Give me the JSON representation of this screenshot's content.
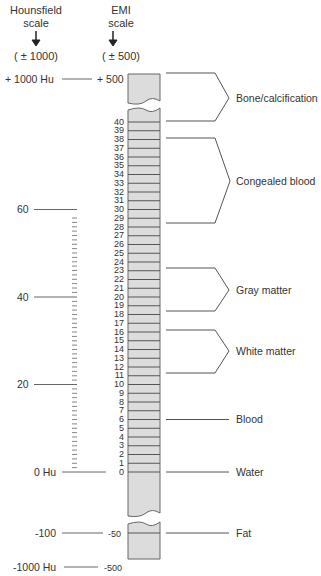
{
  "header": {
    "hounsfield": {
      "line1": "Hounsfield",
      "line2": "scale",
      "range": "( ± 1000)"
    },
    "emi": {
      "line1": "EMI",
      "line2": "scale",
      "range": "( ± 500)"
    }
  },
  "hounsfield_labels": {
    "top": "+ 1000 Hu",
    "h60": "60",
    "h40": "40",
    "h20": "20",
    "zero": "0 Hu",
    "fat": "-100",
    "bottom": "-1000 Hu"
  },
  "emi_labels": {
    "top": "+ 500",
    "fat": "-50",
    "bottom": "-500",
    "rows": [
      "40",
      "39",
      "38",
      "37",
      "36",
      "35",
      "34",
      "33",
      "32",
      "31",
      "30",
      "29",
      "28",
      "27",
      "26",
      "25",
      "24",
      "23",
      "22",
      "21",
      "20",
      "19",
      "18",
      "17",
      "16",
      "15",
      "14",
      "13",
      "12",
      "11",
      "10",
      "9",
      "8",
      "7",
      "6",
      "5",
      "4",
      "3",
      "2",
      "1",
      "0"
    ]
  },
  "tissues": {
    "bone": "Bone/calcification",
    "congealed": "Congealed blood",
    "gray": "Gray matter",
    "white": "White matter",
    "blood": "Blood",
    "water": "Water",
    "fat": "Fat"
  },
  "colors": {
    "column_fill": "#dcdcdc",
    "line": "#555555",
    "text": "#333333"
  }
}
